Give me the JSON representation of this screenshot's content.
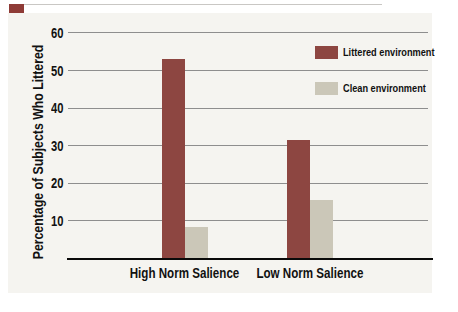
{
  "figure": {
    "corner_tab_color": "#8e3b36",
    "panel_background": "#f5f4f0",
    "gridline_color": "#8e8e8e",
    "axis_line_color": "#0a0a0a"
  },
  "chart_data": {
    "type": "bar",
    "title": "",
    "categories": [
      "High Norm Salience",
      "Low Norm Salience"
    ],
    "series": [
      {
        "name": "Littered environment",
        "color": "#8d4641",
        "values": [
          53,
          31.5
        ]
      },
      {
        "name": "Clean environment",
        "color": "#cbc7b8",
        "values": [
          8.5,
          15.5
        ]
      }
    ],
    "xlabel": "",
    "ylabel": "Percentage of Subjects Who Littered",
    "yticks": [
      10,
      20,
      30,
      40,
      50,
      60
    ],
    "ylim": [
      0,
      60
    ],
    "grid": true,
    "legend_position": "top-right"
  }
}
